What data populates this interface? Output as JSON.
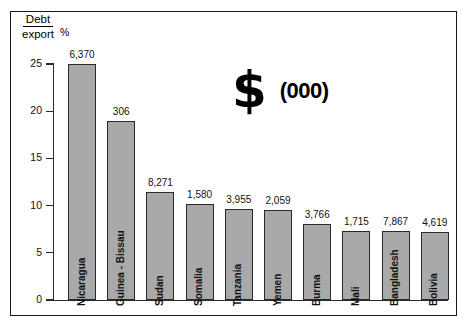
{
  "axis_header": {
    "numerator": "Debt",
    "denominator": "export",
    "unit": "%"
  },
  "annotation": {
    "dollar_glyph": "$",
    "thousands_label": "(000)"
  },
  "colors": {
    "bar_fill": "#a9a9a9",
    "bar_stroke": "#2a2a2a",
    "axis": "#2b2b2b",
    "frame": "#1a1a1a",
    "background": "#ffffff",
    "text": "#111111"
  },
  "chart_data": {
    "type": "bar",
    "title": "",
    "subtitle": "",
    "xlabel": "",
    "ylabel": "Debt/export %",
    "ylim": [
      0,
      25
    ],
    "yticks": [
      0,
      5,
      10,
      15,
      20,
      25
    ],
    "ytick_labels": [
      "0",
      "5",
      "10",
      "15",
      "20",
      "25"
    ],
    "grid": false,
    "legend_position": "none",
    "annotations": [
      "$",
      "(000)"
    ],
    "value_label_note": "Numbers above bars are debt per capita in $ (000)",
    "categories": [
      "Nicaragua",
      "Guinea - Bissau",
      "Sudan",
      "Somalia",
      "Tanzania",
      "Yemen",
      "Burma",
      "Mali",
      "Bangladesh",
      "Bolivia"
    ],
    "values": [
      25.0,
      19.0,
      11.4,
      10.2,
      9.6,
      9.5,
      8.1,
      7.3,
      7.3,
      7.2
    ],
    "bar_labels": [
      "6,370",
      "306",
      "8,271",
      "1,580",
      "3,955",
      "2,059",
      "3,766",
      "1,715",
      "7,867",
      "4,619"
    ]
  }
}
